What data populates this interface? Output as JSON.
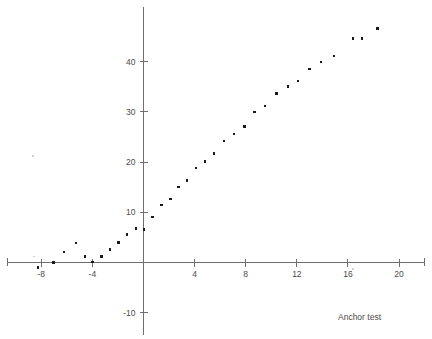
{
  "figure": {
    "caption": "Anchor test",
    "background_color": "#ffffff",
    "point_color": "#1a1a1a",
    "axis_color": "#6e6e6e",
    "text_color": "#4a4a4a"
  },
  "chart_data": {
    "type": "scatter",
    "title": "",
    "subtitle": "",
    "xlabel": "",
    "ylabel": "",
    "annotations": [
      "Anchor test"
    ],
    "grid": false,
    "legend": false,
    "legend_position": "none",
    "xlim": [
      -9.5,
      22.0
    ],
    "ylim": [
      -13.0,
      48.5
    ],
    "xticks": [
      -8,
      -4,
      0,
      4,
      8,
      12,
      16,
      20
    ],
    "xtick_labels": [
      "-8",
      "-4",
      "",
      "4",
      "8",
      "12",
      "16",
      "20"
    ],
    "yticks": [
      -10,
      10,
      20,
      30,
      40
    ],
    "ytick_labels": [
      "-10",
      "10",
      "20",
      "30",
      "40"
    ],
    "x": [
      -8.2,
      -7.0,
      -6.2,
      -5.3,
      -4.6,
      -4.0,
      -3.3,
      -2.6,
      -2.0,
      -1.3,
      -0.6,
      0.0,
      0.6,
      1.3,
      2.0,
      2.6,
      3.3,
      4.0,
      4.6,
      5.3,
      6.0,
      6.9,
      7.6,
      8.4,
      9.2,
      10.0,
      10.8,
      11.6,
      12.4,
      13.2,
      14.0,
      15.0,
      16.0,
      17.0,
      18.0,
      18.9,
      20.1,
      20.8,
      21.5
    ],
    "y": [
      -1.0,
      0.0,
      2.0,
      3.8,
      1.2,
      0.0,
      1.1,
      2.6,
      4.0,
      5.5,
      6.8,
      6.6,
      9.0,
      11.3,
      12.6,
      15.0,
      16.2,
      18.8,
      20.1,
      21.6,
      24.1,
      25.6,
      27.0,
      30.0,
      31.2,
      33.6,
      35.0,
      36.1,
      38.6,
      40.0,
      41.1,
      44.6,
      44.6,
      46.6,
      0.0,
      0.0,
      0.0,
      0.0,
      0.0
    ],
    "points": [
      {
        "x": -8.25,
        "y": -1.0
      },
      {
        "x": -7.05,
        "y": 0.0
      },
      {
        "x": -6.2,
        "y": 2.1
      },
      {
        "x": -5.3,
        "y": 3.9
      },
      {
        "x": -4.6,
        "y": 1.2
      },
      {
        "x": -4.0,
        "y": 0.1
      },
      {
        "x": -3.3,
        "y": 1.2
      },
      {
        "x": -2.6,
        "y": 2.6
      },
      {
        "x": -1.95,
        "y": 4.0
      },
      {
        "x": -1.3,
        "y": 5.6
      },
      {
        "x": -0.6,
        "y": 6.8
      },
      {
        "x": 0.05,
        "y": 6.6
      },
      {
        "x": 0.7,
        "y": 9.1
      },
      {
        "x": 1.4,
        "y": 11.4
      },
      {
        "x": 2.1,
        "y": 12.7
      },
      {
        "x": 2.75,
        "y": 15.0
      },
      {
        "x": 3.4,
        "y": 16.3
      },
      {
        "x": 4.1,
        "y": 18.8
      },
      {
        "x": 4.8,
        "y": 20.1
      },
      {
        "x": 5.5,
        "y": 21.7
      },
      {
        "x": 6.3,
        "y": 24.2
      },
      {
        "x": 7.1,
        "y": 25.6
      },
      {
        "x": 7.9,
        "y": 27.1
      },
      {
        "x": 8.7,
        "y": 30.0
      },
      {
        "x": 9.5,
        "y": 31.2
      },
      {
        "x": 10.4,
        "y": 33.7
      },
      {
        "x": 11.3,
        "y": 35.1
      },
      {
        "x": 12.1,
        "y": 36.1
      },
      {
        "x": 13.0,
        "y": 38.6
      },
      {
        "x": 13.9,
        "y": 40.0
      },
      {
        "x": 14.9,
        "y": 41.1
      },
      {
        "x": 16.4,
        "y": 44.6
      },
      {
        "x": 17.1,
        "y": 44.6
      },
      {
        "x": 18.3,
        "y": 46.6
      }
    ]
  }
}
